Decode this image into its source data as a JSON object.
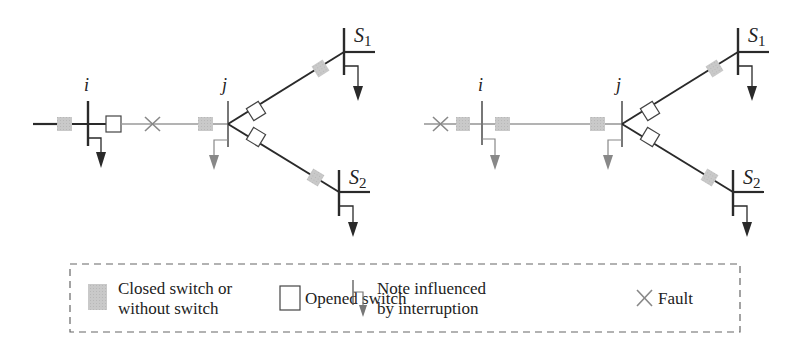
{
  "figure": {
    "type": "distribution-network-single-line-diagram",
    "colors": {
      "line_dark": "#2a2a2a",
      "line_gray": "#9a9a9a",
      "closed_switch": "#c8c8c8",
      "opened_switch_fill": "#ffffff",
      "affected_load": "#777777",
      "normal_load": "#2a2a2a",
      "fault": "#888888",
      "legend_border": "#666666"
    },
    "panels": [
      {
        "id": "left",
        "labels": {
          "bus_i": "i",
          "bus_j": "j",
          "s1": "S",
          "s1_sub": "1",
          "s2": "S",
          "s2_sub": "2"
        },
        "fault_position": "between i and j"
      },
      {
        "id": "right",
        "labels": {
          "bus_i": "i",
          "bus_j": "j",
          "s1": "S",
          "s1_sub": "1",
          "s2": "S",
          "s2_sub": "2"
        },
        "fault_position": "upstream of i"
      }
    ]
  },
  "legend": {
    "items": [
      {
        "icon": "closed-switch-icon",
        "line1": "Closed switch or",
        "line2": "without switch"
      },
      {
        "icon": "opened-switch-icon",
        "line1": "Opened switch"
      },
      {
        "icon": "interrupted-node-icon",
        "line1": "Note influenced",
        "line2": "by interruption"
      },
      {
        "icon": "fault-icon",
        "line1": "Fault"
      }
    ]
  }
}
